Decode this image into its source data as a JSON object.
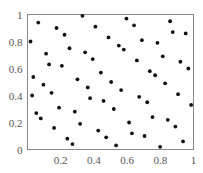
{
  "chart_data": {
    "type": "scatter",
    "title": "",
    "xlabel": "",
    "ylabel": "",
    "xlim": [
      0,
      1
    ],
    "ylim": [
      0,
      1
    ],
    "grid": false,
    "legend": null,
    "x_ticks": [
      "0.2",
      "0.4",
      "0.6",
      "0.8",
      "1"
    ],
    "y_ticks": [
      "0",
      "0.2",
      "0.4",
      "0.6",
      "0.8",
      "1"
    ],
    "marker_color": "#111111",
    "frame_color": "#888888",
    "points": [
      [
        0.018,
        0.8
      ],
      [
        0.028,
        0.4
      ],
      [
        0.035,
        0.537
      ],
      [
        0.053,
        0.27
      ],
      [
        0.065,
        0.94
      ],
      [
        0.08,
        0.23
      ],
      [
        0.096,
        0.48
      ],
      [
        0.112,
        0.71
      ],
      [
        0.13,
        0.63
      ],
      [
        0.145,
        0.42
      ],
      [
        0.16,
        0.16
      ],
      [
        0.175,
        0.9
      ],
      [
        0.19,
        0.31
      ],
      [
        0.207,
        0.62
      ],
      [
        0.223,
        0.85
      ],
      [
        0.24,
        0.08
      ],
      [
        0.253,
        0.75
      ],
      [
        0.271,
        0.04
      ],
      [
        0.285,
        0.28
      ],
      [
        0.301,
        0.52
      ],
      [
        0.317,
        0.19
      ],
      [
        0.331,
        0.99
      ],
      [
        0.347,
        0.72
      ],
      [
        0.363,
        0.46
      ],
      [
        0.377,
        0.38
      ],
      [
        0.393,
        0.67
      ],
      [
        0.409,
        0.91
      ],
      [
        0.426,
        0.14
      ],
      [
        0.442,
        0.57
      ],
      [
        0.458,
        0.36
      ],
      [
        0.474,
        0.09
      ],
      [
        0.488,
        0.83
      ],
      [
        0.504,
        0.5
      ],
      [
        0.52,
        0.3
      ],
      [
        0.534,
        0.03
      ],
      [
        0.55,
        0.77
      ],
      [
        0.564,
        0.44
      ],
      [
        0.58,
        0.74
      ],
      [
        0.596,
        0.97
      ],
      [
        0.612,
        0.2
      ],
      [
        0.629,
        0.12
      ],
      [
        0.642,
        0.92
      ],
      [
        0.659,
        0.66
      ],
      [
        0.673,
        0.39
      ],
      [
        0.689,
        0.81
      ],
      [
        0.705,
        0.1
      ],
      [
        0.721,
        0.35
      ],
      [
        0.737,
        0.58
      ],
      [
        0.753,
        0.24
      ],
      [
        0.769,
        0.55
      ],
      [
        0.783,
        0.79
      ],
      [
        0.799,
        0.02
      ],
      [
        0.815,
        0.69
      ],
      [
        0.829,
        0.49
      ],
      [
        0.845,
        0.22
      ],
      [
        0.859,
        0.95
      ],
      [
        0.875,
        0.87
      ],
      [
        0.891,
        0.17
      ],
      [
        0.907,
        0.41
      ],
      [
        0.921,
        0.65
      ],
      [
        0.937,
        0.06
      ],
      [
        0.953,
        0.86
      ],
      [
        0.969,
        0.6
      ],
      [
        0.986,
        0.33
      ]
    ]
  }
}
